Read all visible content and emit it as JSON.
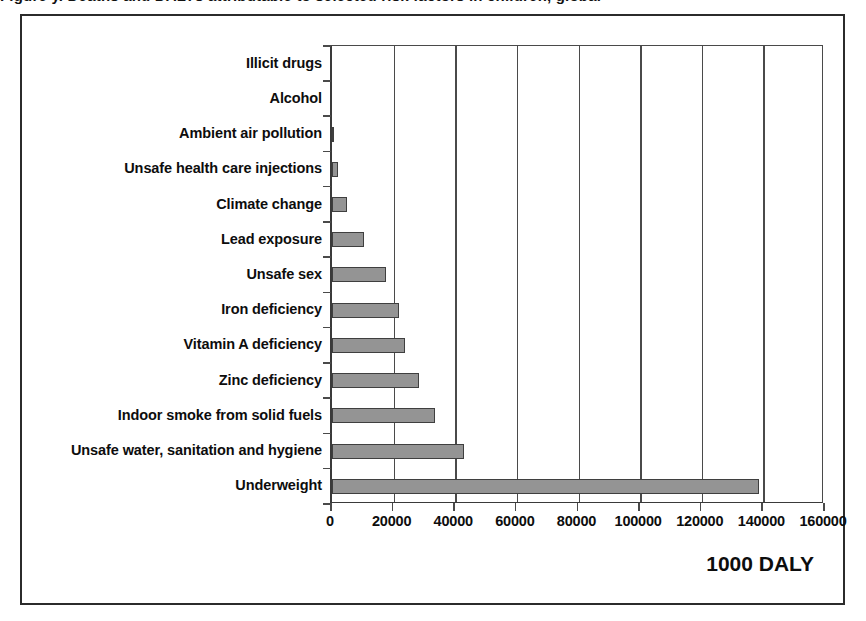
{
  "caption_sliver": "Figure y. Deaths and DALYs attributable to selected risk factors in children, global",
  "axis_unit_label": "1000 DALY",
  "chart_data": {
    "type": "bar",
    "orientation": "horizontal",
    "title": "",
    "xlabel": "1000 DALY",
    "ylabel": "",
    "categories": [
      "Illicit drugs",
      "Alcohol",
      "Ambient air pollution",
      "Unsafe health care injections",
      "Climate change",
      "Lead exposure",
      "Unsafe sex",
      "Iron deficiency",
      "Vitamin A deficiency",
      "Zinc deficiency",
      "Indoor smoke from solid fuels",
      "Unsafe water, sanitation and hygiene",
      "Underweight"
    ],
    "values": [
      0,
      0,
      600,
      1800,
      4900,
      10400,
      17500,
      21700,
      23700,
      28200,
      33400,
      42800,
      138600
    ],
    "xlim": [
      0,
      160000
    ],
    "xticks": [
      0,
      20000,
      40000,
      60000,
      80000,
      100000,
      120000,
      140000,
      160000
    ],
    "xtick_labels": [
      "0",
      "20000",
      "40000",
      "60000",
      "80000",
      "100000",
      "120000",
      "140000",
      "160000"
    ],
    "grid": "vertical",
    "legend": "none",
    "bar_color": "#949494",
    "bar_border_color": "#3f3f3f",
    "axis_color": "#4a4a4a",
    "background_color": "#ffffff"
  }
}
